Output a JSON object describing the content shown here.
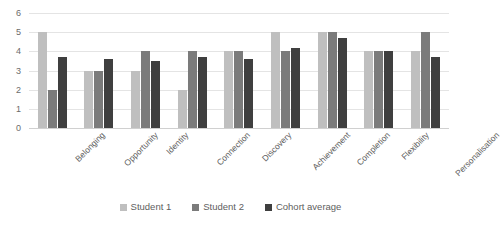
{
  "chart_data": {
    "type": "bar",
    "title": "",
    "subtitle": "",
    "xlabel": "",
    "ylabel": "",
    "ylim": [
      0,
      6
    ],
    "ytick_step": 1,
    "yticks": [
      0,
      1,
      2,
      3,
      4,
      5,
      6
    ],
    "grid": true,
    "legend_position": "bottom",
    "orientation": "vertical",
    "grouping": "clustered",
    "categories": [
      "Belonging",
      "Opportunity",
      "Identity",
      "Connection",
      "Discovery",
      "Achievement",
      "Completion",
      "Flexibility",
      "Personalisation"
    ],
    "series": [
      {
        "name": "Student 1",
        "color": "#bfbfbf",
        "values": [
          5,
          3,
          3,
          2,
          4,
          5,
          5,
          4,
          4
        ]
      },
      {
        "name": "Student 2",
        "color": "#7b7b7b",
        "values": [
          2,
          3,
          4,
          4,
          4,
          4,
          5,
          4,
          5
        ]
      },
      {
        "name": "Cohort average",
        "color": "#3f3f3f",
        "values": [
          3.7,
          3.6,
          3.5,
          3.7,
          3.6,
          4.2,
          4.7,
          4.0,
          3.7
        ]
      }
    ]
  },
  "legend": {
    "items": [
      {
        "label": "Student 1",
        "color": "#bfbfbf"
      },
      {
        "label": "Student 2",
        "color": "#7b7b7b"
      },
      {
        "label": "Cohort average",
        "color": "#3f3f3f"
      }
    ]
  },
  "colors": {
    "series_1": "#bfbfbf",
    "series_2": "#7b7b7b",
    "series_3": "#3f3f3f",
    "gridline": "#e4e4e4",
    "axis_text": "#5e5e5e",
    "background": "#ffffff"
  }
}
